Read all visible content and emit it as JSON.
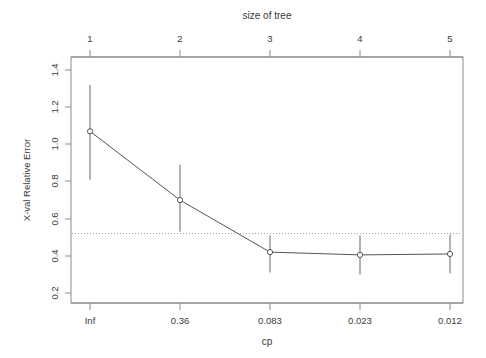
{
  "chart_data": {
    "type": "line",
    "title": "",
    "top_axis_label": "size of tree",
    "xlabel": "cp",
    "ylabel": "X-val Relative Error",
    "x_positions": [
      1,
      2,
      3,
      4,
      5
    ],
    "top_tick_labels": [
      "1",
      "2",
      "3",
      "4",
      "5"
    ],
    "bottom_tick_labels": [
      "Inf",
      "0.36",
      "0.083",
      "0.023",
      "0.012"
    ],
    "y_tick_labels": [
      "0.2",
      "0.4",
      "0.6",
      "0.8",
      "1.0",
      "1.2",
      "1.4"
    ],
    "y_tick_values": [
      0.2,
      0.4,
      0.6,
      0.8,
      1.0,
      1.2,
      1.4
    ],
    "ylim": [
      0.16,
      1.47
    ],
    "xlim": [
      0.6,
      5.4
    ],
    "grid": false,
    "legend": "none",
    "marker": "open-circle",
    "series": [
      {
        "name": "X-val Relative Error",
        "values": [
          1.07,
          0.7,
          0.42,
          0.405,
          0.41
        ],
        "lower": [
          0.81,
          0.53,
          0.31,
          0.3,
          0.305
        ],
        "upper": [
          1.32,
          0.89,
          0.51,
          0.51,
          0.515
        ]
      }
    ],
    "reference_line": {
      "type": "horizontal-dotted",
      "value": 0.52
    },
    "colors": {
      "line": "#555555",
      "error_bar": "#666666",
      "axis": "#777777",
      "reference": "#999999",
      "text": "#3a3a3a"
    }
  }
}
